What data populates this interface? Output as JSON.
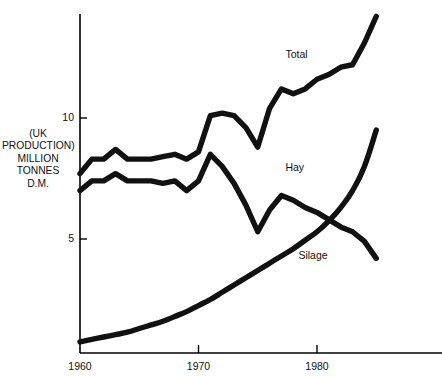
{
  "chart_data": {
    "type": "line",
    "title": "",
    "subtitle": "",
    "xlabel": "",
    "ylabel": "(UK PRODUCTION) MILLION TONNES D.M.",
    "ylabel_lines": [
      "(UK",
      "PRODUCTION)",
      "MILLION",
      "TONNES",
      "D.M."
    ],
    "xlim": [
      1960,
      1985
    ],
    "ylim": [
      0,
      14.6
    ],
    "x_ticks": [
      1960,
      1970,
      1980
    ],
    "x_tick_labels": [
      "1960",
      "1970",
      "1980"
    ],
    "y_ticks": [
      5,
      10
    ],
    "y_tick_labels": [
      "5",
      "10"
    ],
    "grid": false,
    "legend_position": "inline-annotations",
    "line_color": "#111111",
    "background_color": "#ffffff",
    "x": [
      1960,
      1961,
      1962,
      1963,
      1964,
      1965,
      1966,
      1967,
      1968,
      1969,
      1970,
      1971,
      1972,
      1973,
      1974,
      1975,
      1976,
      1977,
      1978,
      1979,
      1980,
      1981,
      1982,
      1983,
      1984,
      1985
    ],
    "series": [
      {
        "name": "Total",
        "label": "Total",
        "values": [
          7.7,
          8.3,
          8.3,
          8.7,
          8.3,
          8.3,
          8.3,
          8.4,
          8.5,
          8.3,
          8.6,
          10.1,
          10.2,
          10.1,
          9.6,
          8.8,
          10.4,
          11.2,
          11.0,
          11.2,
          11.6,
          11.8,
          12.1,
          12.2,
          13.1,
          14.2
        ]
      },
      {
        "name": "Hay",
        "label": "Hay",
        "values": [
          7.0,
          7.4,
          7.4,
          7.7,
          7.4,
          7.4,
          7.4,
          7.3,
          7.4,
          7.0,
          7.4,
          8.5,
          8.0,
          7.3,
          6.4,
          5.3,
          6.2,
          6.8,
          6.6,
          6.3,
          6.1,
          5.8,
          5.5,
          5.3,
          4.9,
          4.2
        ]
      },
      {
        "name": "Silage",
        "label": "Silage",
        "values": [
          0.75,
          0.85,
          0.95,
          1.05,
          1.15,
          1.3,
          1.45,
          1.6,
          1.8,
          2.0,
          2.25,
          2.5,
          2.8,
          3.1,
          3.4,
          3.7,
          4.0,
          4.3,
          4.6,
          4.95,
          5.3,
          5.75,
          6.3,
          7.0,
          8.0,
          9.5
        ]
      }
    ],
    "annotations": [
      {
        "text": "Total",
        "x": 1977.5,
        "y": 12.6
      },
      {
        "text": "Hay",
        "x": 1977.5,
        "y": 7.95
      },
      {
        "text": "Silage",
        "x": 1978.6,
        "y": 4.3
      }
    ]
  }
}
